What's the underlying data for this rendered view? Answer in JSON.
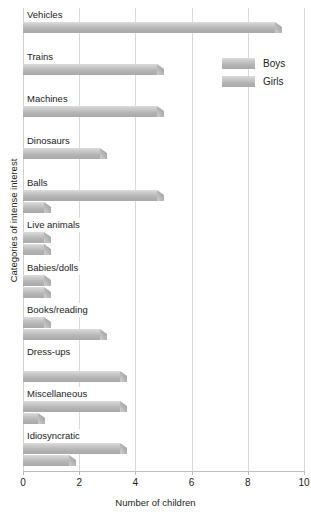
{
  "chart_data": {
    "type": "bar",
    "orientation": "horizontal",
    "title": "",
    "xlabel": "Number of children",
    "ylabel": "Categories of intense interest",
    "xlim": [
      0,
      10
    ],
    "xticks": [
      "0",
      "2",
      "4",
      "6",
      "8",
      "10"
    ],
    "xtick_values": [
      0,
      2,
      4,
      6,
      8,
      10
    ],
    "grid": "vertical",
    "legend_position": "upper right inside plot",
    "categories": [
      "Vehicles",
      "Trains",
      "Machines",
      "Dinosaurs",
      "Balls",
      "Live animals",
      "Babies/dolls",
      "Books/reading",
      "Dress-ups",
      "Miscellaneous",
      "Idiosyncratic"
    ],
    "series": [
      {
        "name": "Boys",
        "values": [
          9.2,
          5,
          5,
          3,
          5,
          1,
          1,
          1,
          0,
          3.7,
          3.7
        ]
      },
      {
        "name": "Girls",
        "values": [
          0,
          0,
          0,
          0,
          1,
          1,
          1,
          3,
          3.7,
          0.8,
          1.9
        ]
      }
    ]
  },
  "legend": {
    "items": [
      {
        "label": "Boys"
      },
      {
        "label": "Girls"
      }
    ]
  }
}
